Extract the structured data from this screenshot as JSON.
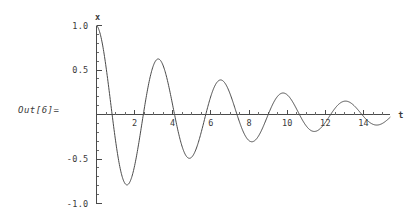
{
  "output_label": "Out[6]=",
  "chart_data": {
    "type": "line",
    "title": "",
    "subtitle": "",
    "xlabel": "t",
    "ylabel": "x",
    "xlim": [
      0,
      15.4
    ],
    "ylim": [
      -1.0,
      1.0
    ],
    "grid": false,
    "legend": null,
    "x_ticks_major": [
      2,
      4,
      6,
      8,
      10,
      12,
      14
    ],
    "x_tick_labels": [
      "2",
      "4",
      "6",
      "8",
      "10",
      "12",
      "14"
    ],
    "x_tick_minor_step": 0.5,
    "y_ticks_major": [
      1.0,
      0.5,
      -0.5,
      -1.0
    ],
    "y_tick_labels": [
      "1.0",
      "0.5",
      "-0.5",
      "-1.0"
    ],
    "y_tick_minor_step": 0.1,
    "curve_color": "#4a4a4a",
    "axis_color": "#4a4a4a",
    "background_color": "#ffffff",
    "model": {
      "amplitude": 1.0,
      "decay_rate": 0.145,
      "angular_frequency": 1.92,
      "phase": 0.0
    },
    "x": [
      0,
      0.1,
      0.2,
      0.3,
      0.4,
      0.5,
      0.6,
      0.7,
      0.8,
      0.9,
      1.0,
      1.1,
      1.2,
      1.3,
      1.4,
      1.5,
      1.6,
      1.7,
      1.8,
      1.9,
      2.0,
      2.1,
      2.2,
      2.3,
      2.4,
      2.5,
      2.6,
      2.7,
      2.8,
      2.9,
      3.0,
      3.1,
      3.2,
      3.3,
      3.4,
      3.5,
      3.6,
      3.7,
      3.8,
      3.9,
      4.0,
      4.2,
      4.4,
      4.6,
      4.8,
      5.0,
      5.2,
      5.4,
      5.6,
      5.8,
      6.0,
      6.2,
      6.4,
      6.6,
      6.8,
      7.0,
      7.2,
      7.4,
      7.6,
      7.8,
      8.0,
      8.2,
      8.4,
      8.6,
      8.8,
      9.0,
      9.2,
      9.4,
      9.6,
      9.8,
      10.0,
      10.2,
      10.4,
      10.6,
      10.8,
      11.0,
      11.2,
      11.4,
      11.6,
      11.8,
      12.0,
      12.2,
      12.4,
      12.6,
      12.8,
      13.0,
      13.2,
      13.4,
      13.6,
      13.8,
      14.0,
      14.2,
      14.4,
      14.6,
      14.8,
      15.0,
      15.2,
      15.4
    ],
    "y": [
      1.0,
      0.968,
      0.874,
      0.726,
      0.537,
      0.322,
      0.099,
      -0.116,
      -0.311,
      -0.472,
      -0.592,
      -0.664,
      -0.687,
      -0.662,
      -0.594,
      -0.489,
      -0.357,
      -0.208,
      -0.053,
      0.099,
      0.239,
      0.359,
      0.452,
      0.512,
      0.537,
      0.527,
      0.483,
      0.409,
      0.312,
      0.199,
      0.078,
      -0.043,
      -0.157,
      -0.257,
      -0.336,
      -0.389,
      -0.414,
      -0.41,
      -0.378,
      -0.322,
      -0.245,
      -0.06,
      0.13,
      0.272,
      0.34,
      0.326,
      0.238,
      0.099,
      -0.058,
      -0.198,
      -0.288,
      -0.308,
      -0.256,
      -0.146,
      -0.006,
      0.13,
      0.228,
      0.266,
      0.24,
      0.157,
      0.036,
      -0.091,
      -0.19,
      -0.238,
      -0.223,
      -0.152,
      -0.044,
      0.071,
      0.161,
      0.203,
      0.19,
      0.128,
      0.036,
      -0.06,
      -0.135,
      -0.17,
      -0.159,
      -0.105,
      -0.025,
      0.059,
      0.125,
      0.157,
      0.145,
      0.094,
      0.019,
      -0.058,
      -0.117,
      -0.143,
      -0.13,
      -0.083,
      -0.016,
      0.053,
      0.106,
      0.128,
      0.115,
      0.071,
      0.01,
      -0.051
    ]
  }
}
